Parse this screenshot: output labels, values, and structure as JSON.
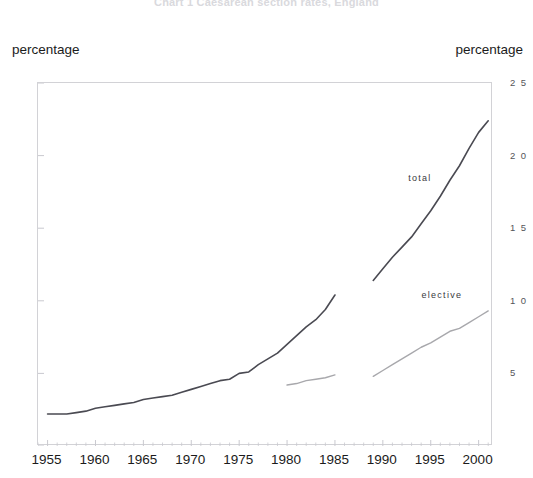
{
  "figure": {
    "title_faint": "Chart 1   Caesarean section rates, England",
    "left_axis_caption": "percentage",
    "right_axis_caption": "percentage"
  },
  "chart_data": {
    "type": "line",
    "title": "",
    "xlabel": "",
    "ylabel": "percentage",
    "y2label": "percentage",
    "xlim": [
      1954,
      2001.5
    ],
    "ylim": [
      0,
      25
    ],
    "y2lim": [
      0,
      25
    ],
    "grid": false,
    "legend_position": "inline-annotation",
    "x_major_ticks": [
      1955,
      1960,
      1965,
      1970,
      1975,
      1980,
      1985,
      1990,
      1995,
      2000
    ],
    "x_minor_tick_interval": 1,
    "y_ticks_left": [
      0,
      5,
      10,
      15,
      20,
      25
    ],
    "y_ticks_right": [
      5,
      10,
      15,
      20,
      25
    ],
    "annotations": [
      {
        "text": "total",
        "x": 1995.2,
        "y": 18.4
      },
      {
        "text": "elective",
        "x": 1998.4,
        "y": 10.3
      }
    ],
    "series": [
      {
        "name": "total",
        "color": "#4a4a52",
        "width": 1.6,
        "segments": [
          {
            "label": "1955-1985",
            "x": [
              1955,
              1956,
              1957,
              1958,
              1959,
              1960,
              1961,
              1962,
              1963,
              1964,
              1965,
              1966,
              1967,
              1968,
              1969,
              1970,
              1971,
              1972,
              1973,
              1974,
              1975,
              1976,
              1977,
              1978,
              1979,
              1980,
              1981,
              1982,
              1983,
              1984,
              1985
            ],
            "y": [
              2.2,
              2.2,
              2.2,
              2.3,
              2.4,
              2.6,
              2.7,
              2.8,
              2.9,
              3.0,
              3.2,
              3.3,
              3.4,
              3.5,
              3.7,
              3.9,
              4.1,
              4.3,
              4.5,
              4.6,
              5.0,
              5.1,
              5.6,
              6.0,
              6.4,
              7.0,
              7.6,
              8.2,
              8.7,
              9.4,
              10.4
            ]
          },
          {
            "label": "1989-2001",
            "x": [
              1989,
              1990,
              1991,
              1992,
              1993,
              1994,
              1995,
              1996,
              1997,
              1998,
              1999,
              2000,
              2001
            ],
            "y": [
              11.4,
              12.2,
              13.0,
              13.7,
              14.4,
              15.3,
              16.2,
              17.2,
              18.3,
              19.3,
              20.5,
              21.6,
              22.4
            ]
          }
        ]
      },
      {
        "name": "elective",
        "color": "#a8a8ac",
        "width": 1.4,
        "segments": [
          {
            "label": "1980-1985",
            "x": [
              1980,
              1981,
              1982,
              1983,
              1984,
              1985
            ],
            "y": [
              4.2,
              4.3,
              4.5,
              4.6,
              4.7,
              4.9
            ]
          },
          {
            "label": "1989-2001",
            "x": [
              1989,
              1990,
              1991,
              1992,
              1993,
              1994,
              1995,
              1996,
              1997,
              1998,
              1999,
              2000,
              2001
            ],
            "y": [
              4.8,
              5.2,
              5.6,
              6.0,
              6.4,
              6.8,
              7.1,
              7.5,
              7.9,
              8.1,
              8.5,
              8.9,
              9.3
            ]
          }
        ]
      }
    ]
  }
}
